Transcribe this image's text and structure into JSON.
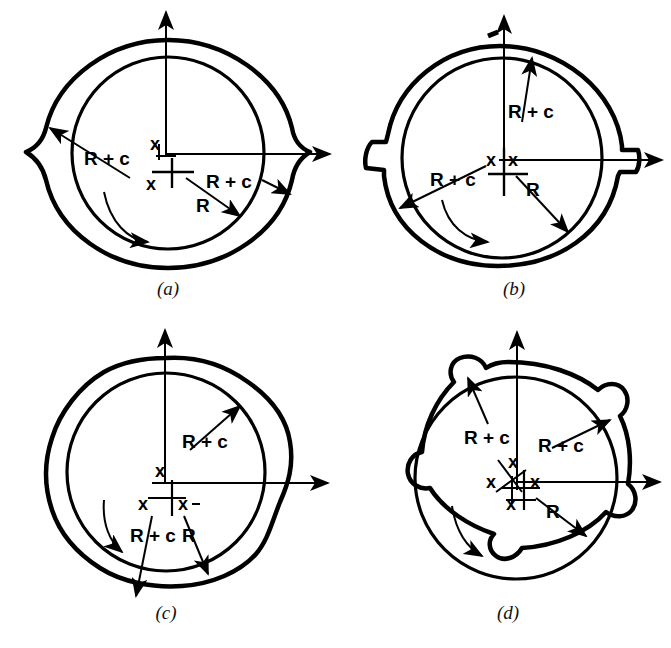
{
  "figure": {
    "background": "#ffffff",
    "ink_color": "#000000",
    "panel_count": 4
  },
  "labels": {
    "radius": "R",
    "radius_clearance": "R + c",
    "center_mark": "x",
    "center_mark_pair": "x-x"
  },
  "captions": {
    "a": "(a)",
    "b": "(b)",
    "c": "(c)",
    "d": "(d)"
  },
  "panels": [
    {
      "id": "a",
      "caption": "(a)",
      "lobes": 2,
      "lobe_style": "lemon-elliptical",
      "center_marks": [
        "x",
        "x"
      ],
      "annotations": [
        {
          "text": "R + c",
          "target": "outer-lobe-upper-left"
        },
        {
          "text": "R + c",
          "target": "outer-lobe-right"
        },
        {
          "text": "R",
          "target": "inner-bore-lower-right"
        }
      ],
      "rotation_arrow": "clockwise",
      "axes": [
        "vertical-up",
        "horizontal-right"
      ]
    },
    {
      "id": "b",
      "caption": "(b)",
      "lobes": 2,
      "lobe_style": "offset-halves-stepped",
      "center_marks": [
        "x",
        "x"
      ],
      "annotations": [
        {
          "text": "R + c",
          "target": "outer-lobe-top"
        },
        {
          "text": "R + c",
          "target": "outer-lobe-lower-left"
        },
        {
          "text": "R",
          "target": "inner-bore-lower-right"
        }
      ],
      "rotation_arrow": "clockwise",
      "axes": [
        "vertical-up",
        "horizontal-right"
      ]
    },
    {
      "id": "c",
      "caption": "(c)",
      "lobes": 3,
      "lobe_style": "three-lobe",
      "center_marks": [
        "x",
        "x",
        "x"
      ],
      "annotations": [
        {
          "text": "R + c",
          "target": "outer-lobe-upper-right"
        },
        {
          "text": "R + c",
          "target": "outer-lobe-lower-left"
        },
        {
          "text": "R",
          "target": "inner-bore-lower-right"
        }
      ],
      "rotation_arrow": "clockwise",
      "axes": [
        "vertical-up",
        "horizontal-right"
      ]
    },
    {
      "id": "d",
      "caption": "(d)",
      "lobes": 4,
      "lobe_style": "four-lobe",
      "center_marks": [
        "x",
        "x",
        "x",
        "x"
      ],
      "annotations": [
        {
          "text": "R + c",
          "target": "outer-lobe-upper-left"
        },
        {
          "text": "R + c",
          "target": "outer-lobe-upper-right"
        },
        {
          "text": "R",
          "target": "inner-bore-lower-right"
        }
      ],
      "rotation_arrow": "clockwise",
      "axes": [
        "vertical-up",
        "horizontal-right"
      ]
    }
  ]
}
